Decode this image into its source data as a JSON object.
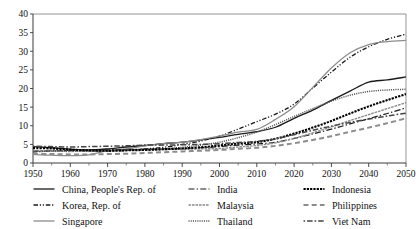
{
  "chart_data": {
    "type": "line",
    "title": "",
    "xlabel": "",
    "ylabel": "",
    "xlim": [
      1950,
      2050
    ],
    "ylim": [
      0,
      40
    ],
    "grid": false,
    "legend_position": "bottom",
    "xticks": [
      1950,
      1960,
      1970,
      1980,
      1990,
      2000,
      2010,
      2020,
      2030,
      2040,
      2050
    ],
    "yticks": [
      0,
      5,
      10,
      15,
      20,
      25,
      30,
      35,
      40
    ],
    "x": [
      1950,
      1955,
      1960,
      1965,
      1970,
      1975,
      1980,
      1985,
      1990,
      1995,
      2000,
      2005,
      2010,
      2015,
      2020,
      2025,
      2030,
      2035,
      2040,
      2045,
      2050
    ],
    "series": [
      {
        "name": "China, People's Rep. of",
        "style": "solid",
        "color": "#1a1a1a",
        "width": 1.3,
        "values": [
          4.4,
          4.1,
          3.7,
          3.5,
          3.8,
          4.3,
          4.7,
          5.2,
          5.6,
          6.2,
          6.9,
          7.7,
          8.4,
          9.6,
          12.0,
          14.2,
          16.8,
          19.3,
          21.7,
          22.3,
          23.1
        ]
      },
      {
        "name": "Korea, Rep. of",
        "style": "dashdotdot",
        "color": "#1a1a1a",
        "width": 1.3,
        "values": [
          3.0,
          3.2,
          3.4,
          3.3,
          3.2,
          3.4,
          3.8,
          4.2,
          5.0,
          5.9,
          7.2,
          9.1,
          11.1,
          13.1,
          15.8,
          20.1,
          24.4,
          28.4,
          31.2,
          33.2,
          34.6
        ]
      },
      {
        "name": "Singapore",
        "style": "solid",
        "color": "#8c8c8c",
        "width": 1.3,
        "values": [
          2.3,
          2.1,
          2.0,
          2.2,
          3.3,
          3.8,
          4.6,
          5.2,
          5.6,
          6.3,
          7.2,
          8.3,
          9.0,
          11.7,
          15.1,
          20.3,
          25.5,
          29.6,
          31.8,
          32.6,
          32.9
        ]
      },
      {
        "name": "India",
        "style": "dashdot",
        "color": "#1a1a1a",
        "width": 1.2,
        "values": [
          3.2,
          3.3,
          3.4,
          3.4,
          3.5,
          3.6,
          3.7,
          3.8,
          3.9,
          4.1,
          4.4,
          4.8,
          5.1,
          5.6,
          6.6,
          7.8,
          9.1,
          10.5,
          11.9,
          13.3,
          14.8
        ]
      },
      {
        "name": "Malaysia",
        "style": "fine",
        "color": "#8c8c8c",
        "width": 1.4,
        "values": [
          3.3,
          3.2,
          3.1,
          3.2,
          3.3,
          3.4,
          3.5,
          3.6,
          3.7,
          3.8,
          3.9,
          4.3,
          4.7,
          5.4,
          6.6,
          8.1,
          9.7,
          11.4,
          13.0,
          14.6,
          16.2
        ]
      },
      {
        "name": "Thailand",
        "style": "dotted",
        "color": "#555555",
        "width": 1.5,
        "values": [
          3.1,
          3.2,
          3.2,
          3.2,
          3.3,
          3.4,
          3.6,
          3.8,
          4.2,
          4.8,
          5.6,
          6.8,
          8.3,
          10.3,
          12.5,
          14.6,
          16.6,
          18.2,
          19.2,
          19.6,
          19.8
        ]
      },
      {
        "name": "Indonesia",
        "style": "heavydot",
        "color": "#000000",
        "width": 2.1,
        "values": [
          4.0,
          3.9,
          3.6,
          3.4,
          3.3,
          3.4,
          3.5,
          3.7,
          3.9,
          4.2,
          4.7,
          5.2,
          5.6,
          6.5,
          7.9,
          9.5,
          11.3,
          13.3,
          15.2,
          16.9,
          18.5
        ]
      },
      {
        "name": "Philippines",
        "style": "dashed",
        "color": "#8c8c8c",
        "width": 2.0,
        "values": [
          2.5,
          2.4,
          2.3,
          2.3,
          2.4,
          2.5,
          2.7,
          2.9,
          3.1,
          3.3,
          3.5,
          3.8,
          4.1,
          4.6,
          5.3,
          6.2,
          7.2,
          8.4,
          9.5,
          10.7,
          12.0
        ]
      },
      {
        "name": "Viet Nam",
        "style": "dashdotvn",
        "color": "#444444",
        "width": 1.5,
        "values": [
          4.5,
          4.4,
          4.3,
          4.4,
          4.5,
          4.6,
          4.8,
          4.8,
          4.9,
          5.0,
          5.2,
          5.5,
          5.8,
          6.5,
          7.6,
          8.8,
          9.9,
          10.9,
          11.8,
          12.6,
          13.4
        ]
      }
    ]
  },
  "legend": {
    "columns": [
      [
        {
          "label": "China, People's Rep. of",
          "series": 0
        },
        {
          "label": "Korea, Rep. of",
          "series": 1
        },
        {
          "label": "Singapore",
          "series": 2
        }
      ],
      [
        {
          "label": "India",
          "series": 3
        },
        {
          "label": "Malaysia",
          "series": 4
        },
        {
          "label": "Thailand",
          "series": 5
        }
      ],
      [
        {
          "label": "Indonesia",
          "series": 6
        },
        {
          "label": "Philippines",
          "series": 7
        },
        {
          "label": "Viet Nam",
          "series": 8
        }
      ]
    ]
  }
}
